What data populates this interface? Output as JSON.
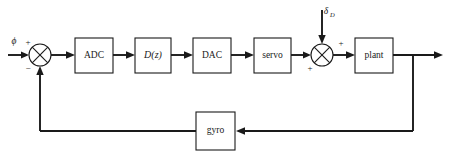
{
  "diagram": {
    "type": "control-system-block-diagram",
    "title": "",
    "blocks": [
      {
        "id": "adc",
        "label": "ADC",
        "x": 75,
        "y": 38,
        "w": 38,
        "h": 35,
        "italic": false
      },
      {
        "id": "dz",
        "label": "D(z)",
        "x": 135,
        "y": 38,
        "w": 36,
        "h": 35,
        "italic": true
      },
      {
        "id": "dac",
        "label": "DAC",
        "x": 193,
        "y": 38,
        "w": 38,
        "h": 35,
        "italic": false
      },
      {
        "id": "servo",
        "label": "servo",
        "x": 254,
        "y": 38,
        "w": 37,
        "h": 35,
        "italic": false
      },
      {
        "id": "plant",
        "label": "plant",
        "x": 355,
        "y": 38,
        "w": 38,
        "h": 35,
        "italic": false
      },
      {
        "id": "gyro",
        "label": "gyro",
        "x": 196,
        "y": 112,
        "w": 39,
        "h": 38,
        "italic": false
      }
    ],
    "summing_junctions": [
      {
        "id": "error-junction",
        "cx": 40,
        "cy": 55,
        "r": 11,
        "signs": [
          {
            "text": "+",
            "x": 28,
            "y": 43
          },
          {
            "text": "−",
            "x": 28,
            "y": 68
          }
        ]
      },
      {
        "id": "disturbance-junction",
        "cx": 322,
        "cy": 55,
        "r": 11,
        "signs": [
          {
            "text": "+",
            "x": 310,
            "y": 68
          },
          {
            "text": "+",
            "x": 340,
            "y": 44
          }
        ]
      }
    ],
    "signals": [
      {
        "id": "reference-input",
        "label": "ϕ",
        "sub": "",
        "x": 14,
        "y": 42
      },
      {
        "id": "disturbance-input",
        "label": "δ",
        "sub": "D",
        "x": 326,
        "y": 12
      }
    ],
    "paths": {
      "forward_chain": [
        "reference-input",
        "error-junction",
        "ADC",
        "D(z)",
        "DAC",
        "servo",
        "disturbance-junction",
        "plant",
        "output"
      ],
      "feedback_chain": [
        "output",
        "gyro",
        "error-junction"
      ],
      "disturbance_chain": [
        "disturbance-input",
        "disturbance-junction"
      ]
    },
    "colors": {
      "line": "#1a1a1a",
      "block_fill": "#ffffff",
      "background": "#ffffff"
    }
  }
}
